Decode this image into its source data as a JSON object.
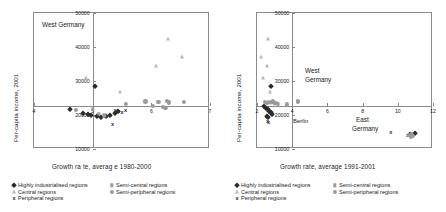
{
  "figure": {
    "panels": [
      {
        "id": "left",
        "xaxis_title": "Growth ra te, averag e 1980-2000",
        "yaxis_title": "Per-capita  income, 2001",
        "annotation": "West Germany",
        "xticks": [
          "4",
          "6",
          "7"
        ],
        "yticks": [
          "50000",
          "40000",
          "30000",
          "20000",
          "10000"
        ]
      },
      {
        "id": "right",
        "xaxis_title": "Growth rate, average 1991-2001",
        "yaxis_title": "Per-capita income, 2001",
        "annotation_west_1": "West",
        "annotation_west_2": "Germany",
        "annotation_east_1": "East",
        "annotation_east_2": "Germany",
        "annotation_berlin": "Berlin",
        "xticks": [
          "2",
          "4",
          "6",
          "8",
          "10",
          "12"
        ],
        "yticks": [
          "50000",
          "40000",
          "30000",
          "20000",
          "10000"
        ]
      }
    ],
    "legend": [
      {
        "label": "Highly industrialised regions",
        "marker": "diamond-marker",
        "color": "#2b2b2b"
      },
      {
        "label": "Central regions",
        "marker": "triangle-marker",
        "color": "#b8b8b8"
      },
      {
        "label": "Peripheral regions",
        "marker": "cross-marker",
        "color": "#2b2b2b"
      },
      {
        "label": "Semi-central regions",
        "marker": "square-marker",
        "color": "#9a9a9a"
      },
      {
        "label": "Semi-peripheral regions",
        "marker": "circle-marker",
        "color": "#9a9a9a"
      }
    ],
    "cross_glyph": "x"
  },
  "chart_data": [
    {
      "type": "scatter",
      "title": "West Germany",
      "xlabel": "Growth ra te, averag e 1980-2000",
      "ylabel": "Per-capita  income, 2001",
      "xlim": [
        4,
        7
      ],
      "ylim": [
        10000,
        50000
      ],
      "xticks": [
        4,
        5,
        6,
        7
      ],
      "yticks": [
        10000,
        20000,
        30000,
        40000,
        50000
      ],
      "grid": false,
      "legend_position": "below",
      "series": [
        {
          "name": "Highly industrialised regions",
          "marker": "diamond",
          "color": "#2b2b2b",
          "points": [
            [
              5.04,
              28400
            ],
            [
              4.62,
              21800
            ],
            [
              4.84,
              20700
            ],
            [
              4.92,
              20300
            ],
            [
              4.98,
              19900
            ],
            [
              5.08,
              19600
            ],
            [
              5.15,
              19500
            ],
            [
              5.22,
              19700
            ],
            [
              5.3,
              20100
            ],
            [
              5.38,
              20600
            ],
            [
              5.44,
              21200
            ]
          ]
        },
        {
          "name": "Central regions",
          "marker": "triangle",
          "color": "#b8b8b8",
          "points": [
            [
              6.28,
              42400
            ],
            [
              6.52,
              37000
            ],
            [
              6.08,
              34400
            ],
            [
              4.88,
              30900
            ],
            [
              5.46,
              26900
            ]
          ]
        },
        {
          "name": "Peripheral regions",
          "marker": "cross",
          "color": "#2b2b2b",
          "points": [
            [
              5.38,
              21600
            ],
            [
              5.44,
              21300
            ],
            [
              5.5,
              21000
            ],
            [
              5.56,
              21400
            ],
            [
              5.34,
              17500
            ]
          ]
        },
        {
          "name": "Semi-central regions",
          "marker": "square",
          "color": "#9a9a9a",
          "points": [
            [
              5.0,
              21700
            ],
            [
              5.1,
              20400
            ],
            [
              5.2,
              19900
            ]
          ]
        },
        {
          "name": "Semi-peripheral regions",
          "marker": "circle",
          "color": "#9a9a9a",
          "points": [
            [
              5.56,
              23200
            ],
            [
              5.9,
              24000
            ],
            [
              6.12,
              23900
            ],
            [
              6.26,
              24200
            ],
            [
              6.3,
              23700
            ],
            [
              6.56,
              23900
            ],
            [
              6.02,
              22600
            ],
            [
              6.2,
              22400
            ],
            [
              6.24,
              22200
            ],
            [
              4.72,
              21600
            ]
          ]
        }
      ]
    },
    {
      "type": "scatter",
      "title": "Germany, 1991-2001",
      "xlabel": "Growth rate, average 1991-2001",
      "ylabel": "Per-capita income, 2001",
      "xlim": [
        2,
        12
      ],
      "ylim": [
        10000,
        50000
      ],
      "xticks": [
        2,
        4,
        6,
        8,
        10,
        12
      ],
      "yticks": [
        10000,
        20000,
        30000,
        40000,
        50000
      ],
      "grid": false,
      "legend_position": "below",
      "annotations": [
        {
          "text": "West Germany",
          "x": 5.0,
          "y": 31000
        },
        {
          "text": "Berlin",
          "x": 4.1,
          "y": 21200
        },
        {
          "text": "East Germany",
          "x": 8.3,
          "y": 20000
        }
      ],
      "series": [
        {
          "name": "Highly industrialised regions",
          "marker": "diamond",
          "color": "#2b2b2b",
          "points": [
            [
              2.78,
              28400
            ],
            [
              2.4,
              22600
            ],
            [
              2.52,
              22200
            ],
            [
              2.62,
              21700
            ],
            [
              2.7,
              21300
            ],
            [
              2.8,
              20800
            ],
            [
              2.88,
              20300
            ],
            [
              2.56,
              19700
            ],
            [
              2.64,
              19300
            ],
            [
              11.0,
              14600
            ],
            [
              10.7,
              14300
            ]
          ]
        },
        {
          "name": "Central regions",
          "marker": "triangle",
          "color": "#b8b8b8",
          "points": [
            [
              2.62,
              42400
            ],
            [
              2.2,
              37000
            ],
            [
              2.56,
              34400
            ],
            [
              2.34,
              30900
            ],
            [
              2.74,
              26900
            ]
          ]
        },
        {
          "name": "Peripheral regions",
          "marker": "cross",
          "color": "#2b2b2b",
          "points": [
            [
              2.66,
              21400
            ],
            [
              2.72,
              20900
            ],
            [
              2.6,
              18300
            ],
            [
              2.66,
              17800
            ],
            [
              9.6,
              15100
            ],
            [
              10.55,
              14000
            ]
          ]
        },
        {
          "name": "Semi-central regions",
          "marker": "square",
          "color": "#9a9a9a",
          "points": [
            [
              2.7,
              23700
            ],
            [
              2.86,
              23500
            ],
            [
              3.0,
              23300
            ],
            [
              10.8,
              14500
            ]
          ]
        },
        {
          "name": "Semi-peripheral regions",
          "marker": "circle",
          "color": "#9a9a9a",
          "points": [
            [
              2.44,
              23900
            ],
            [
              2.58,
              23600
            ],
            [
              2.9,
              24000
            ],
            [
              3.06,
              23600
            ],
            [
              3.2,
              23300
            ],
            [
              3.72,
              23100
            ],
            [
              4.34,
              24000
            ],
            [
              10.65,
              14200
            ],
            [
              10.85,
              13900
            ],
            [
              10.75,
              13600
            ]
          ]
        }
      ]
    }
  ]
}
